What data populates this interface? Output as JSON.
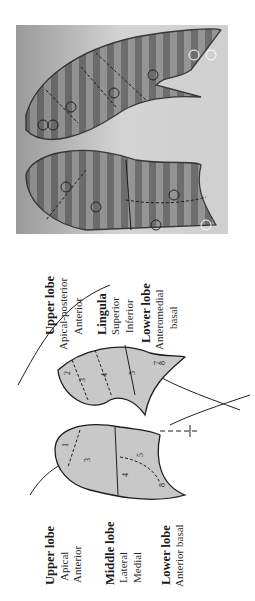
{
  "figure": {
    "orientation": "rotated-90-ccw",
    "xray": {
      "name": "chest-radiograph-segment-overlay",
      "right_lung_segments": [
        "1",
        "2",
        "3",
        "4",
        "5",
        "8"
      ],
      "left_lung_segments": [
        "1",
        "3",
        "4",
        "5",
        "7",
        "8"
      ]
    },
    "diagram": {
      "right_lung": {
        "segment_numbers": [
          "1",
          "3",
          "4",
          "5",
          "8"
        ],
        "labels": {
          "upper_lobe": "Upper lobe",
          "apical": "Apical",
          "anterior": "Anterior",
          "middle_lobe": "Middle lobe",
          "lateral": "Lateral",
          "medial": "Medial",
          "lower_lobe": "Lower lobe",
          "anterior_basal": "Anterior basal"
        }
      },
      "left_lung": {
        "segment_numbers": [
          "2",
          "3",
          "4",
          "5",
          "7",
          "8"
        ],
        "labels": {
          "upper_lobe": "Upper lobe",
          "apical_posterior": "Apical-posterior",
          "anterior": "Anterior",
          "lingula": "Lingula",
          "superior": "Superior",
          "inferior": "Inferior",
          "lower_lobe": "Lower lobe",
          "anteromedial": "Anteromedial",
          "basal": "basal"
        }
      }
    },
    "colors": {
      "lung_fill": "#c8c8c8",
      "outline": "#1e1e1e",
      "xray_bg": "#bdbdbd"
    }
  }
}
